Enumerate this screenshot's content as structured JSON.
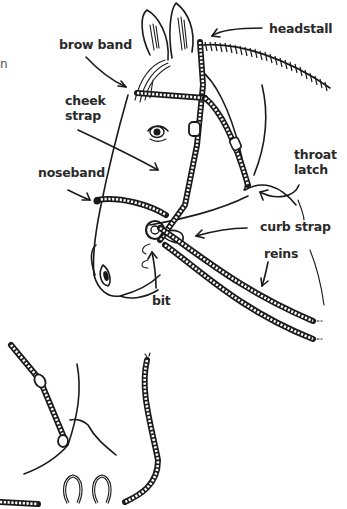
{
  "diagram": {
    "edge_fragment": "n",
    "labels": [
      {
        "id": "headstall",
        "text": "headstall"
      },
      {
        "id": "brow-band",
        "text": "brow band"
      },
      {
        "id": "cheek-strap",
        "text": "cheek\nstrap"
      },
      {
        "id": "throat-latch",
        "text": "throat\nlatch"
      },
      {
        "id": "noseband",
        "text": "noseband"
      },
      {
        "id": "curb-strap",
        "text": "curb strap"
      },
      {
        "id": "reins",
        "text": "reins"
      },
      {
        "id": "bit",
        "text": "bit"
      }
    ],
    "cheek_strap": {
      "line1": "cheek",
      "line2": "strap"
    },
    "throat_latch": {
      "line1": "throat",
      "line2": "latch"
    },
    "extras": [
      "detached throat latch strap",
      "loose rope",
      "two horseshoes",
      "rope end"
    ]
  }
}
